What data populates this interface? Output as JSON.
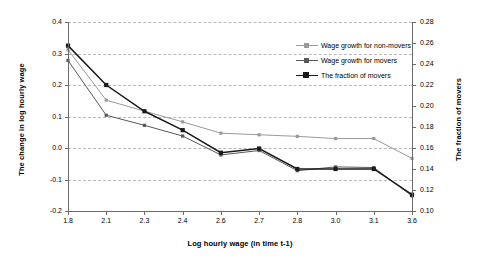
{
  "chart_data": {
    "type": "line",
    "title": "",
    "xlabel": "Log hourly wage (in time t-1)",
    "ylabel": "The change in log hourly wage",
    "y2label": "The fraction of movers",
    "categories": [
      "1.8",
      "2.1",
      "2.3",
      "2.4",
      "2.6",
      "2.7",
      "2.8",
      "3.0",
      "3.1",
      "3.6"
    ],
    "ylim": [
      -0.2,
      0.4
    ],
    "yticks": [
      "0.4",
      "0.3",
      "0.2",
      "0.1",
      "0.0",
      "-0.1",
      "-0.2"
    ],
    "y2lim": [
      0.1,
      0.28
    ],
    "y2ticks": [
      "0.28",
      "0.26",
      "0.24",
      "0.22",
      "0.20",
      "0.18",
      "0.16",
      "0.14",
      "0.12",
      "0.10"
    ],
    "grid": true,
    "legend_position": "upper-right",
    "series": [
      {
        "name": "Wage growth for non-movers",
        "axis": "left",
        "color": "#9a9a9a",
        "values": [
          0.312,
          0.152,
          0.117,
          0.083,
          0.047,
          0.042,
          0.037,
          0.03,
          0.03,
          -0.033
        ]
      },
      {
        "name": "Wage growth for movers",
        "axis": "left",
        "color": "#585858",
        "values": [
          0.278,
          0.104,
          0.072,
          0.038,
          -0.022,
          -0.008,
          -0.072,
          -0.06,
          -0.062,
          -0.152
        ]
      },
      {
        "name": "The fraction of movers",
        "axis": "right",
        "color": "#1a1a1a",
        "values": [
          0.2575,
          0.22,
          0.195,
          0.177,
          0.1555,
          0.1595,
          0.14,
          0.14,
          0.14,
          0.1155
        ]
      }
    ]
  },
  "legend": {
    "items": [
      {
        "label": "Wage growth for non-movers"
      },
      {
        "label": "Wage growth for movers"
      },
      {
        "label": "The fraction of movers"
      }
    ]
  }
}
